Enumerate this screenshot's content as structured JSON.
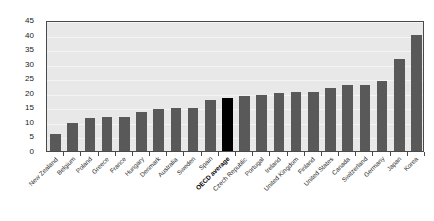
{
  "chart_data": {
    "type": "bar",
    "title": "",
    "subtitle": "",
    "xlabel": "",
    "ylabel": "",
    "ylim": [
      0,
      45
    ],
    "yticks": [
      0,
      5,
      10,
      15,
      20,
      25,
      30,
      35,
      40,
      45
    ],
    "grid": true,
    "legend": "none",
    "highlight_category": "OECD average",
    "highlight_color": "#000000",
    "bar_color": "#595959",
    "plot_background": "#e8e8e8",
    "categories": [
      "New Zealand",
      "Belgium",
      "Poland",
      "Greece",
      "France",
      "Hungary",
      "Denmark",
      "Australia",
      "Sweden",
      "Spain",
      "OECD average",
      "Czech Republic",
      "Portugal",
      "Ireland",
      "United Kingdom",
      "Finland",
      "United States",
      "Canada",
      "Switzerland",
      "Germany",
      "Japan",
      "Korea"
    ],
    "values": [
      6.0,
      9.5,
      11.2,
      11.7,
      11.7,
      13.3,
      14.5,
      14.7,
      14.9,
      17.4,
      18.2,
      18.8,
      19.1,
      19.9,
      20.2,
      20.2,
      21.5,
      22.7,
      22.7,
      24.1,
      31.7,
      39.7
    ]
  }
}
